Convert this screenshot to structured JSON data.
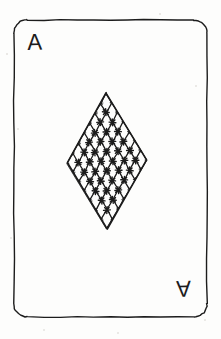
{
  "card": {
    "kind": "playing-card",
    "style": "hand-drawn pen sketch",
    "rank": "A",
    "rank_name": "Ace",
    "suit": "diamonds",
    "suit_symbol": "diamond",
    "corner_rank_top_left": "A",
    "corner_rank_bottom_right": "A",
    "bottom_rank_rotated": true,
    "background_color": "#fdfdfc",
    "ink_color": "#1c1c1c",
    "border": {
      "x": 14,
      "y": 20,
      "width": 193,
      "height": 297,
      "corner_radius": 13,
      "stroke_width": 1.4
    },
    "pip": {
      "label": "diamond-pip",
      "fill_style": "cross-hatch lattice with star nodes",
      "top_x": 106,
      "top_y": 93,
      "bottom_x": 107,
      "bottom_y": 229,
      "left_x": 67,
      "left_y": 163,
      "right_x": 147,
      "right_y": 160,
      "lattice_cells_u": 7,
      "lattice_cells_v": 7,
      "node_count": 64,
      "line_width": 1.3,
      "node_radius": 3.4
    }
  },
  "speckles": [
    {
      "x": 18,
      "y": 129,
      "r": 1.1
    },
    {
      "x": 11,
      "y": 238,
      "r": 1.0
    },
    {
      "x": 196,
      "y": 86,
      "r": 0.9
    },
    {
      "x": 44,
      "y": 330,
      "r": 1.0
    },
    {
      "x": 205,
      "y": 320,
      "r": 0.9
    },
    {
      "x": 160,
      "y": 14,
      "r": 0.8
    },
    {
      "x": 7,
      "y": 54,
      "r": 0.8
    },
    {
      "x": 118,
      "y": 333,
      "r": 0.9
    }
  ]
}
